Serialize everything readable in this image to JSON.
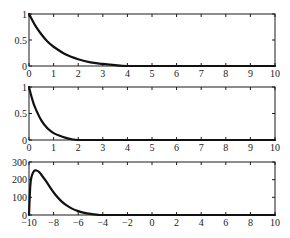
{
  "chart_data": [
    {
      "type": "line",
      "title": "",
      "xlabel": "",
      "ylabel": "",
      "xlim": [
        0,
        10
      ],
      "ylim": [
        0,
        1
      ],
      "xticks": [
        "0",
        "1",
        "2",
        "3",
        "4",
        "5",
        "6",
        "7",
        "8",
        "9",
        "10"
      ],
      "yticks": [
        "0",
        "0.5",
        "1"
      ],
      "grid": false,
      "series": [
        {
          "name": "exp decay (slow)",
          "x": [
            0,
            0.25,
            0.5,
            0.75,
            1,
            1.5,
            2,
            2.5,
            3,
            3.5,
            4,
            5,
            6,
            7,
            8,
            9,
            10
          ],
          "values": [
            1.0,
            0.78,
            0.61,
            0.47,
            0.37,
            0.22,
            0.13,
            0.07,
            0.04,
            0.015,
            0.0,
            0.0,
            0.0,
            0.0,
            0.0,
            0.0,
            0.0
          ]
        }
      ]
    },
    {
      "type": "line",
      "title": "",
      "xlabel": "",
      "ylabel": "",
      "xlim": [
        0,
        10
      ],
      "ylim": [
        0,
        1
      ],
      "xticks": [
        "0",
        "1",
        "2",
        "3",
        "4",
        "5",
        "6",
        "7",
        "8",
        "9",
        "10"
      ],
      "yticks": [
        "0",
        "0.5",
        "1"
      ],
      "grid": false,
      "series": [
        {
          "name": "exp decay (fast)",
          "x": [
            0,
            0.125,
            0.25,
            0.5,
            0.75,
            1,
            1.25,
            1.5,
            1.75,
            2,
            3,
            4,
            5,
            6,
            7,
            8,
            9,
            10
          ],
          "values": [
            1.0,
            0.78,
            0.61,
            0.37,
            0.22,
            0.13,
            0.08,
            0.04,
            0.015,
            0.0,
            0.0,
            0.0,
            0.0,
            0.0,
            0.0,
            0.0,
            0.0,
            0.0
          ]
        }
      ]
    },
    {
      "type": "line",
      "title": "",
      "xlabel": "",
      "ylabel": "",
      "xlim": [
        -10,
        10
      ],
      "ylim": [
        0,
        300
      ],
      "xticks": [
        "-10",
        "-8",
        "-6",
        "-4",
        "-2",
        "0",
        "2",
        "4",
        "6",
        "8",
        "10"
      ],
      "yticks": [
        "0",
        "100",
        "200",
        "300"
      ],
      "grid": false,
      "series": [
        {
          "name": "skewed peak",
          "x": [
            -10,
            -9.9,
            -9.8,
            -9.6,
            -9.4,
            -9.2,
            -9.0,
            -8.6,
            -8.2,
            -7.8,
            -7.4,
            -7.0,
            -6.5,
            -6.0,
            -5.5,
            -5.0,
            -4.5,
            -4.0,
            -2,
            0,
            2,
            4,
            6,
            8,
            10
          ],
          "values": [
            0,
            160,
            215,
            248,
            252,
            245,
            228,
            190,
            148,
            110,
            80,
            57,
            36,
            22,
            12,
            6,
            2,
            0,
            0,
            0,
            0,
            0,
            0,
            0,
            0
          ]
        }
      ]
    }
  ]
}
